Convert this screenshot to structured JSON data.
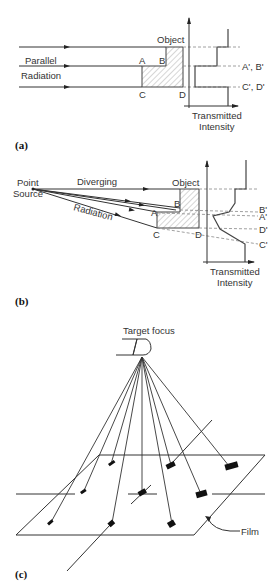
{
  "panels": [
    {
      "id": "a",
      "caption": "(a)",
      "labels": {
        "source": "Parallel",
        "source2": "Radiation",
        "object": "Object",
        "A": "A",
        "B": "B",
        "C": "C",
        "D": "D",
        "proj_ab": "A', B'",
        "proj_cd": "C', D'",
        "axis": "Transmitted",
        "axis2": "Intensity"
      }
    },
    {
      "id": "b",
      "caption": "(b)",
      "labels": {
        "source": "Point",
        "source2": "Source",
        "diverging": "Diverging",
        "radiation": "Radiation",
        "object": "Object",
        "A": "A",
        "B": "B",
        "C": "C",
        "D": "D",
        "proj_b": "B'",
        "proj_a": "A'",
        "proj_d": "D'",
        "proj_c": "C'",
        "axis": "Transmitted",
        "axis2": "Intensity"
      }
    },
    {
      "id": "c",
      "caption": "(c)",
      "labels": {
        "focus": "Target focus",
        "film": "Film"
      }
    }
  ]
}
